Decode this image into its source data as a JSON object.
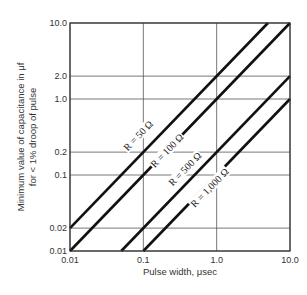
{
  "chart_data": {
    "type": "line",
    "title": "",
    "xlabel": "Pulse width, μsec",
    "ylabel_line1": "Minimum value of capacitance in μf",
    "ylabel_line2": "for < 1% droop of pulse",
    "xscale": "log",
    "yscale": "log",
    "xlim": [
      0.01,
      10.0
    ],
    "ylim": [
      0.01,
      10.0
    ],
    "grid": true,
    "x_ticks": [
      0.01,
      0.1,
      1.0,
      10.0
    ],
    "x_tick_labels": [
      "0.01",
      "0.1",
      "1.0",
      "10.0"
    ],
    "y_ticks": [
      0.01,
      0.02,
      0.1,
      0.2,
      1.0,
      2.0,
      10.0
    ],
    "y_tick_labels": [
      "0.01",
      "0.02",
      "0.1",
      "0.2",
      "1.0",
      "2.0",
      "10.0"
    ],
    "relation": "C = 100 * pulse_width / R",
    "series": [
      {
        "name": "R = 50 Ω",
        "R": 50,
        "x": [
          0.01,
          5.0
        ],
        "y": [
          0.02,
          10.0
        ],
        "label_pos": [
          0.085,
          0.33
        ]
      },
      {
        "name": "R = 100 Ω",
        "R": 100,
        "x": [
          0.01,
          10.0
        ],
        "y": [
          0.01,
          10.0
        ],
        "label_pos": [
          0.21,
          0.21
        ]
      },
      {
        "name": "R = 500 Ω",
        "R": 500,
        "x": [
          0.05,
          10.0
        ],
        "y": [
          0.01,
          2.0
        ],
        "label_pos": [
          0.37,
          0.12
        ]
      },
      {
        "name": "R = 1,000 Ω",
        "R": 1000,
        "x": [
          0.1,
          10.0
        ],
        "y": [
          0.01,
          1.0
        ],
        "label_pos": [
          0.8,
          0.068
        ]
      }
    ]
  }
}
